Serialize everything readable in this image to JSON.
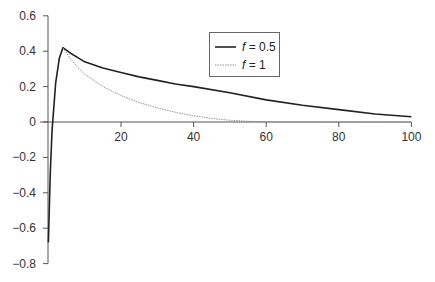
{
  "chart_data": {
    "type": "line",
    "title": "",
    "xlabel": "",
    "ylabel": "",
    "xlim": [
      0,
      100
    ],
    "ylim": [
      -0.8,
      0.6
    ],
    "x_ticks": [
      20,
      40,
      60,
      80,
      100
    ],
    "x_tick_labels": [
      "20",
      "40",
      "60",
      "80",
      "100"
    ],
    "y_ticks": [
      0.6,
      0.4,
      0.2,
      0,
      -0.2,
      -0.4,
      -0.6,
      -0.8
    ],
    "y_tick_labels": [
      "0.6",
      "0.4",
      "0.2",
      "0",
      "−0.2",
      "−0.4",
      "−0.6",
      "−0.8"
    ],
    "grid": false,
    "legend_position": "upper center",
    "series": [
      {
        "name": "f = 0.5",
        "legend_var": "f",
        "legend_value": "= 0.5",
        "style": "solid",
        "color": "#222222",
        "x": [
          0,
          0.5,
          1,
          2,
          3,
          4,
          6,
          8,
          10,
          15,
          20,
          25,
          30,
          35,
          40,
          50,
          60,
          70,
          80,
          90,
          100
        ],
        "y": [
          -0.68,
          -0.3,
          -0.05,
          0.22,
          0.36,
          0.42,
          0.39,
          0.365,
          0.34,
          0.305,
          0.28,
          0.255,
          0.235,
          0.215,
          0.2,
          0.165,
          0.125,
          0.095,
          0.07,
          0.045,
          0.03
        ]
      },
      {
        "name": "f = 1",
        "legend_var": "f",
        "legend_value": "= 1",
        "style": "dotted",
        "color": "#888888",
        "x": [
          4,
          6,
          8,
          10,
          15,
          20,
          25,
          30,
          35,
          40,
          45,
          50,
          55,
          60,
          70,
          80,
          90,
          100
        ],
        "y": [
          0.42,
          0.36,
          0.31,
          0.27,
          0.2,
          0.15,
          0.11,
          0.08,
          0.055,
          0.035,
          0.02,
          0.01,
          0.004,
          0.001,
          0,
          0,
          0,
          0
        ]
      }
    ]
  }
}
